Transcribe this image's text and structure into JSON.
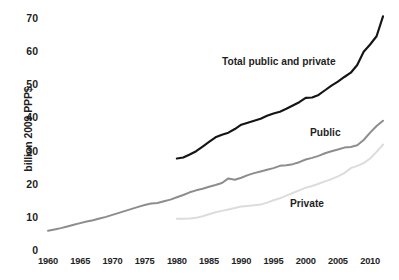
{
  "chart_data": {
    "type": "line",
    "title": "",
    "subtitle": "",
    "xlabel": "",
    "ylabel": "billion 2009 PPP$",
    "xlim": [
      1960,
      2012
    ],
    "ylim": [
      0,
      70
    ],
    "grid": false,
    "legend_position": "inline-annotations",
    "xticks": [
      "1960",
      "1965",
      "1970",
      "1975",
      "1980",
      "1985",
      "1990",
      "1995",
      "2000",
      "2005",
      "2010"
    ],
    "yticks": [
      "0",
      "10",
      "20",
      "30",
      "40",
      "50",
      "60",
      "70"
    ],
    "colors": {
      "total": "#151515",
      "public": "#8d8d8d",
      "private": "#dcdcdc"
    },
    "annotations": [
      {
        "text": "Total public and private",
        "series": "total"
      },
      {
        "text": "Public",
        "series": "public"
      },
      {
        "text": "Private",
        "series": "private"
      }
    ],
    "series": [
      {
        "name": "Total public and private",
        "label": "Total public and private",
        "color": "#151515",
        "x": [
          1980,
          1981,
          1982,
          1983,
          1984,
          1985,
          1986,
          1987,
          1988,
          1989,
          1990,
          1991,
          1992,
          1993,
          1994,
          1995,
          1996,
          1997,
          1998,
          1999,
          2000,
          2001,
          2002,
          2003,
          2004,
          2005,
          2006,
          2007,
          2008,
          2009,
          2010,
          2011,
          2012
        ],
        "values": [
          27.6,
          27.9,
          28.8,
          29.8,
          31.2,
          32.6,
          34.0,
          34.8,
          35.4,
          36.5,
          37.8,
          38.4,
          39.0,
          39.6,
          40.5,
          41.2,
          41.7,
          42.6,
          43.6,
          44.6,
          45.9,
          46.0,
          46.8,
          48.2,
          49.6,
          50.8,
          52.2,
          53.5,
          55.8,
          59.8,
          62.0,
          64.5,
          70.5
        ]
      },
      {
        "name": "Public",
        "label": "Public",
        "color": "#8d8d8d",
        "x": [
          1960,
          1961,
          1962,
          1963,
          1964,
          1965,
          1966,
          1967,
          1968,
          1969,
          1970,
          1971,
          1972,
          1973,
          1974,
          1975,
          1976,
          1977,
          1978,
          1979,
          1980,
          1981,
          1982,
          1983,
          1984,
          1985,
          1986,
          1987,
          1988,
          1989,
          1990,
          1991,
          1992,
          1993,
          1994,
          1995,
          1996,
          1997,
          1998,
          1999,
          2000,
          2001,
          2002,
          2003,
          2004,
          2005,
          2006,
          2007,
          2008,
          2009,
          2010,
          2011,
          2012
        ],
        "values": [
          5.8,
          6.2,
          6.6,
          7.1,
          7.6,
          8.1,
          8.6,
          9.0,
          9.5,
          10.0,
          10.6,
          11.2,
          11.8,
          12.4,
          13.0,
          13.6,
          14.0,
          14.2,
          14.7,
          15.2,
          15.9,
          16.6,
          17.4,
          18.0,
          18.5,
          19.1,
          19.6,
          20.2,
          21.6,
          21.2,
          21.8,
          22.6,
          23.2,
          23.7,
          24.2,
          24.7,
          25.4,
          25.6,
          25.9,
          26.5,
          27.3,
          27.8,
          28.4,
          29.2,
          29.8,
          30.3,
          30.9,
          31.1,
          31.6,
          33.2,
          35.4,
          37.4,
          39.0
        ]
      },
      {
        "name": "Private",
        "label": "Private",
        "color": "#dcdcdc",
        "x": [
          1980,
          1981,
          1982,
          1983,
          1984,
          1985,
          1986,
          1987,
          1988,
          1989,
          1990,
          1991,
          1992,
          1993,
          1994,
          1995,
          1996,
          1997,
          1998,
          1999,
          2000,
          2001,
          2002,
          2003,
          2004,
          2005,
          2006,
          2007,
          2008,
          2009,
          2010,
          2011,
          2012
        ],
        "values": [
          9.4,
          9.4,
          9.5,
          9.7,
          10.2,
          10.8,
          11.4,
          11.8,
          12.2,
          12.7,
          13.1,
          13.3,
          13.5,
          13.7,
          14.3,
          15.0,
          15.6,
          16.4,
          17.2,
          18.0,
          18.8,
          19.3,
          20.0,
          20.7,
          21.4,
          22.2,
          23.2,
          24.7,
          25.4,
          26.2,
          27.6,
          29.6,
          31.8
        ]
      }
    ]
  }
}
